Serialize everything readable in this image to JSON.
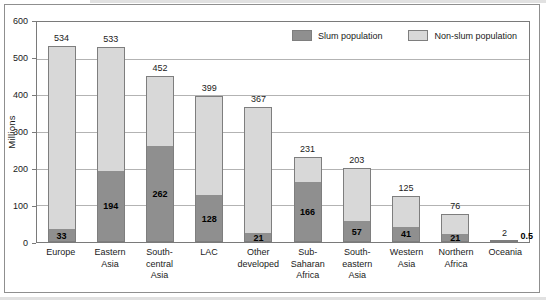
{
  "chart_data": {
    "type": "bar",
    "stacked": true,
    "title": "",
    "ylabel": "Millions",
    "ylim": [
      0,
      600
    ],
    "yticks": [
      0,
      100,
      200,
      300,
      400,
      500,
      600
    ],
    "grid": "horizontal",
    "legend_position": "top-right-inside",
    "categories": [
      "Europe",
      "Eastern\nAsia",
      "South-\ncentral\nAsia",
      "LAC",
      "Other\ndeveloped",
      "Sub-\nSaharan\nAfrica",
      "South-eastern\nAsia",
      "Western\nAsia",
      "Northern\nAfrica",
      "Oceania"
    ],
    "series": [
      {
        "name": "Slum population",
        "color": "#8f8f8f",
        "values": [
          33,
          194,
          262,
          128,
          21,
          166,
          57,
          41,
          21,
          0.5
        ]
      },
      {
        "name": "Non-slum population",
        "color": "#d8d8d8",
        "values": [
          501,
          339,
          190,
          271,
          346,
          65,
          146,
          84,
          55,
          1.5
        ]
      }
    ],
    "total_labels": [
      "534",
      "533",
      "452",
      "399",
      "367",
      "231",
      "203",
      "125",
      "76",
      "2"
    ],
    "slum_value_labels": [
      "33",
      "194",
      "262",
      "128",
      "21",
      "166",
      "57",
      "41",
      "21",
      "0.5"
    ],
    "slum_label_outside_index": 9,
    "bar_border_color": "#7e7e7e",
    "axis_color": "#7a7a7a",
    "gridline_color": "#b3b3b3"
  }
}
